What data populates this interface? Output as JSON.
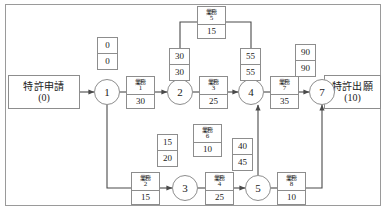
{
  "diagram": {
    "title_start": {
      "name": "特許申請",
      "value": "(0)"
    },
    "title_end": {
      "name": "特許出願",
      "value": "(10)"
    },
    "node_label_prefix": "",
    "nodes": [
      {
        "id": "1",
        "label": "1"
      },
      {
        "id": "2",
        "label": "2"
      },
      {
        "id": "3",
        "label": "3"
      },
      {
        "id": "4",
        "label": "4"
      },
      {
        "id": "5",
        "label": "5"
      },
      {
        "id": "7",
        "label": "7"
      }
    ],
    "tasks": [
      {
        "key": "t1",
        "name": "業務",
        "index": "1",
        "duration": "30"
      },
      {
        "key": "t2",
        "name": "業務",
        "index": "2",
        "duration": "15"
      },
      {
        "key": "t3",
        "name": "業務",
        "index": "3",
        "duration": "25"
      },
      {
        "key": "t4",
        "name": "業務",
        "index": "4",
        "duration": "25"
      },
      {
        "key": "t5",
        "name": "業務",
        "index": "5",
        "duration": "15"
      },
      {
        "key": "t6",
        "name": "業務",
        "index": "6",
        "duration": "10"
      },
      {
        "key": "t7",
        "name": "業務",
        "index": "7",
        "duration": "35"
      },
      {
        "key": "t8",
        "name": "業務",
        "index": "8",
        "duration": "10"
      }
    ],
    "times": [
      {
        "key": "n1",
        "earliest": "0",
        "latest": "0"
      },
      {
        "key": "n2",
        "earliest": "30",
        "latest": "30"
      },
      {
        "key": "n3",
        "earliest": "15",
        "latest": "20"
      },
      {
        "key": "n4",
        "earliest": "55",
        "latest": "55"
      },
      {
        "key": "n5",
        "earliest": "40",
        "latest": "45"
      },
      {
        "key": "n7",
        "earliest": "90",
        "latest": "90"
      }
    ]
  }
}
